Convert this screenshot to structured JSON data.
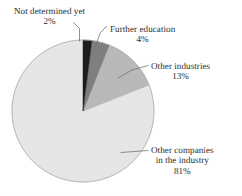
{
  "chart_data": {
    "type": "pie",
    "title": "",
    "subtitle": "",
    "xlabel": "",
    "ylabel": "",
    "legend_position": "none",
    "grid": false,
    "label_style": "external-with-leader-lines",
    "units": "percent",
    "total": 100,
    "start_angle_deg": 0,
    "direction": "clockwise",
    "categories": [
      "Not determined yet",
      "Further education",
      "Other industries",
      "Other companies in the industry"
    ],
    "values": [
      2,
      4,
      13,
      81
    ],
    "slices": [
      {
        "label": "Not determined yet",
        "label_line1": "Not determined yet",
        "label_line2": "",
        "label_line3": "",
        "value": 2,
        "pct_text": "2%",
        "color": "#1d1d1d"
      },
      {
        "label": "Further education",
        "label_line1": "Further education",
        "label_line2": "",
        "label_line3": "",
        "value": 4,
        "pct_text": "4%",
        "color": "#7f7f7f"
      },
      {
        "label": "Other industries",
        "label_line1": "Other industries",
        "label_line2": "",
        "label_line3": "",
        "value": 13,
        "pct_text": "13%",
        "color": "#b9b9b9"
      },
      {
        "label": "Other companies in the industry",
        "label_line1": "Other companies",
        "label_line2": "in the industry",
        "label_line3": "",
        "value": 81,
        "pct_text": "81%",
        "color": "#e6e6e6"
      }
    ]
  },
  "figure": {
    "background": "#ffffff",
    "outline_color": "#9a9a9a",
    "leader_line_color": "#6e6e6e",
    "center_x": 83,
    "center_y": 111,
    "radius": 71
  }
}
